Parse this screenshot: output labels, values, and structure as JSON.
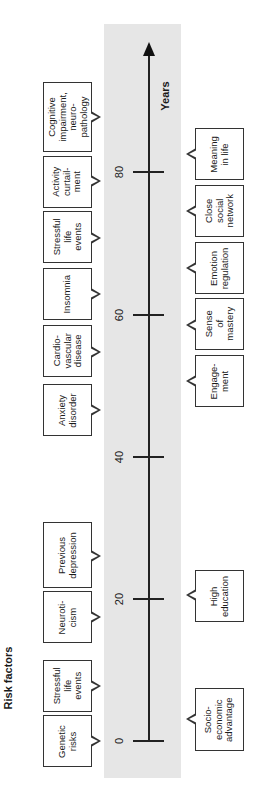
{
  "titles": {
    "risk_factors": "Risk factors",
    "axis_label": "Years"
  },
  "axis": {
    "ticks": [
      {
        "label": "0",
        "y": 741
      },
      {
        "label": "20",
        "y": 599
      },
      {
        "label": "40",
        "y": 457
      },
      {
        "label": "60",
        "y": 315
      },
      {
        "label": "80",
        "y": 172
      }
    ]
  },
  "risk_factors": [
    {
      "label": "Genetic\nrisks",
      "top": 715,
      "height": 52,
      "pointer": 741
    },
    {
      "label": "Stressful\nlife\nevents",
      "top": 660,
      "height": 52,
      "pointer": 686
    },
    {
      "label": "Neuroti-\ncism",
      "top": 591,
      "height": 52,
      "pointer": 617
    },
    {
      "label": "Previous\ndepression",
      "top": 522,
      "height": 66,
      "pointer": 556
    },
    {
      "label": "Anxiety\ndisorder",
      "top": 384,
      "height": 52,
      "pointer": 410
    },
    {
      "label": "Cardio-\nvascular\ndisease",
      "top": 325,
      "height": 52,
      "pointer": 352
    },
    {
      "label": "Insomnia",
      "top": 268,
      "height": 52,
      "pointer": 294
    },
    {
      "label": "Stressful\nlife\nevents",
      "top": 211,
      "height": 52,
      "pointer": 238
    },
    {
      "label": "Activity\ncurtail-\nment",
      "top": 156,
      "height": 52,
      "pointer": 181
    },
    {
      "label": "Cognitive\nimpairment,\nneuro-\npathology",
      "top": 82,
      "height": 70,
      "pointer": 117
    }
  ],
  "protective_factors": [
    {
      "label": "Socio-\neconomic\nadvantage",
      "top": 688,
      "height": 63,
      "pointer": 719
    },
    {
      "label": "High\neducation",
      "top": 570,
      "height": 52,
      "pointer": 595
    },
    {
      "label": "Engage-\nment",
      "top": 355,
      "height": 52,
      "pointer": 381
    },
    {
      "label": "Sense\nof\nmastery",
      "top": 298,
      "height": 52,
      "pointer": 325
    },
    {
      "label": "Emotion\nregulation",
      "top": 242,
      "height": 52,
      "pointer": 268
    },
    {
      "label": "Close\nsocial\nnetwork",
      "top": 185,
      "height": 52,
      "pointer": 211
    },
    {
      "label": "Meaning\nin life",
      "top": 128,
      "height": 52,
      "pointer": 154
    }
  ],
  "colors": {
    "band": "#e6e6e6",
    "line": "#222222",
    "box_border": "#333333"
  }
}
